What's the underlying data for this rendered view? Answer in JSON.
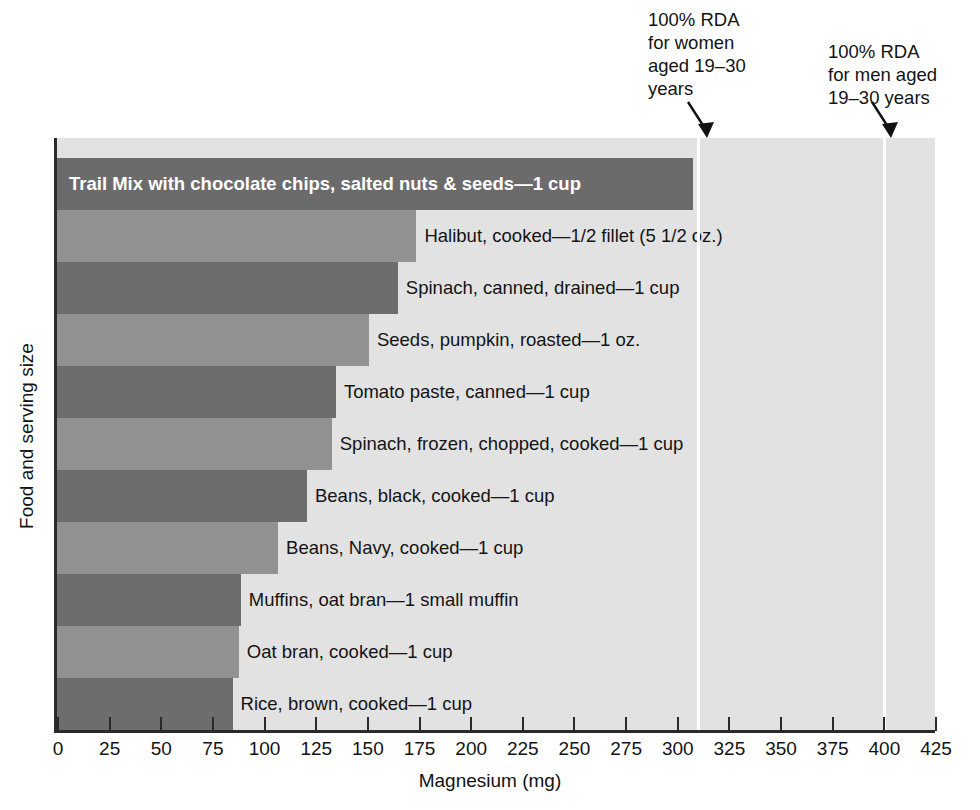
{
  "chart_data": {
    "type": "bar",
    "orientation": "horizontal",
    "title": "",
    "xlabel": "Magnesium (mg)",
    "ylabel": "Food and serving size",
    "xlim": [
      0,
      425
    ],
    "xticks": [
      0,
      25,
      50,
      75,
      100,
      125,
      150,
      175,
      200,
      225,
      250,
      275,
      300,
      325,
      350,
      375,
      400,
      425
    ],
    "grid": false,
    "legend": "none",
    "categories": [
      "Trail Mix with chocolate chips, salted nuts & seeds—1 cup",
      "Halibut, cooked—1/2 fillet (5 1/2 oz.)",
      "Spinach, canned, drained—1 cup",
      "Seeds, pumpkin, roasted—1 oz.",
      "Tomato paste, canned—1 cup",
      "Spinach, frozen, chopped, cooked—1 cup",
      "Beans, black, cooked—1 cup",
      "Beans, Navy, cooked—1 cup",
      "Muffins, oat bran—1 small muffin",
      "Oat bran, cooked—1 cup",
      "Rice, brown, cooked—1 cup"
    ],
    "values": [
      308,
      174,
      165,
      151,
      135,
      133,
      121,
      107,
      89,
      88,
      85
    ],
    "bars": [
      {
        "label": "Trail Mix with chocolate chips, salted nuts & seeds—1 cup",
        "value": 308,
        "color": "#6b6b6b",
        "label_position": "inside"
      },
      {
        "label": "Halibut, cooked—1/2 fillet (5 1/2 oz.)",
        "value": 174,
        "color": "#919191",
        "label_position": "outside"
      },
      {
        "label": "Spinach, canned, drained—1 cup",
        "value": 165,
        "color": "#6d6d6d",
        "label_position": "outside"
      },
      {
        "label": "Seeds, pumpkin, roasted—1 oz.",
        "value": 151,
        "color": "#919191",
        "label_position": "outside"
      },
      {
        "label": "Tomato paste, canned—1 cup",
        "value": 135,
        "color": "#6d6d6d",
        "label_position": "outside"
      },
      {
        "label": "Spinach, frozen, chopped, cooked—1 cup",
        "value": 133,
        "color": "#919191",
        "label_position": "outside"
      },
      {
        "label": "Beans, black, cooked—1 cup",
        "value": 121,
        "color": "#6d6d6d",
        "label_position": "outside"
      },
      {
        "label": "Beans, Navy, cooked—1 cup",
        "value": 107,
        "color": "#919191",
        "label_position": "outside"
      },
      {
        "label": "Muffins, oat bran—1 small muffin",
        "value": 89,
        "color": "#6d6d6d",
        "label_position": "outside"
      },
      {
        "label": "Oat bran, cooked—1 cup",
        "value": 88,
        "color": "#919191",
        "label_position": "outside"
      },
      {
        "label": "Rice, brown, cooked—1 cup",
        "value": 85,
        "color": "#6d6d6d",
        "label_position": "outside"
      }
    ],
    "annotations": [
      {
        "name": "rda-women",
        "text": "100% RDA\nfor women\naged 19–30\nyears",
        "value": 310
      },
      {
        "name": "rda-men",
        "text": "100% RDA\nfor men aged\n19–30 years",
        "value": 400
      }
    ],
    "colors": {
      "plot_background": "#e2e2e2",
      "bar_dark": "#6d6d6d",
      "bar_light": "#919191",
      "reference_line": "#ffffff",
      "axis": "#2a2a2a",
      "text": "#131313"
    }
  }
}
